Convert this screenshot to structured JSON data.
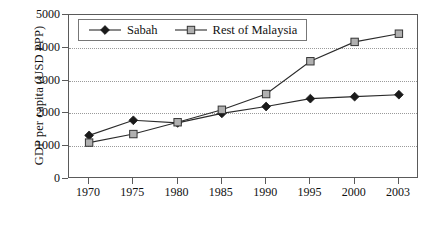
{
  "chart_data": {
    "type": "line",
    "title": "",
    "xlabel": "",
    "ylabel": "GDP per capita (USD PPP)",
    "categories": [
      "1970",
      "1975",
      "1980",
      "1985",
      "1990",
      "1995",
      "2000",
      "2003"
    ],
    "ylim": [
      0,
      5000
    ],
    "ytick_labels": [
      "0",
      "1000",
      "2000",
      "3000",
      "4000",
      "5000"
    ],
    "ytick_values": [
      0,
      1000,
      2000,
      3000,
      4000,
      5000
    ],
    "grid": "horizontal-dotted",
    "legend_position": "top-left-inside",
    "series": [
      {
        "name": "Sabah",
        "marker": "filled-diamond",
        "values": [
          1330,
          1790,
          1710,
          2000,
          2210,
          2450,
          2510,
          2570
        ]
      },
      {
        "name": "Rest of Malaysia",
        "marker": "open-square",
        "values": [
          1110,
          1370,
          1730,
          2110,
          2590,
          3590,
          4180,
          4430
        ]
      }
    ]
  },
  "legend": {
    "entries": [
      {
        "label": "Sabah",
        "icon": "filled-diamond-marker"
      },
      {
        "label": "Rest of Malaysia",
        "icon": "open-square-marker"
      }
    ]
  },
  "colors": {
    "series_line": "#2b2b2b",
    "diamond_fill": "#1a1a1a",
    "square_fill": "#b0b0b0",
    "axis": "#5a5a5a",
    "gridline": "#9a9a9a",
    "background": "#ffffff"
  }
}
